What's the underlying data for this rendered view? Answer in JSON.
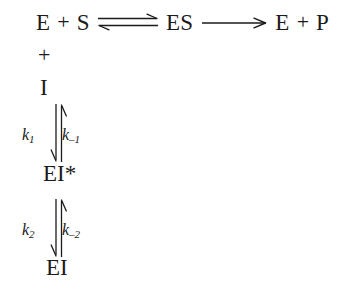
{
  "diagram": {
    "type": "reaction-scheme",
    "background_color": "#ffffff",
    "text_color": "#1b1b1b",
    "top_reaction": {
      "reactant_enzyme": "E",
      "plus_1": "+",
      "reactant_substrate": "S",
      "equilibrium_arrow": "equilibrium-arrow-icon",
      "complex": "ES",
      "forward_arrow": "right-arrow-icon",
      "product_enzyme": "E",
      "plus_2": "+",
      "product": "P"
    },
    "inhibitor_branch": {
      "plus": "+",
      "inhibitor": "I"
    },
    "step_1": {
      "arrow": "vertical-double-arrow-icon",
      "forward_rate_symbol": "k",
      "forward_rate_subscript": "1",
      "reverse_rate_symbol": "k",
      "reverse_rate_subscript": "–1",
      "product": "EI*"
    },
    "step_2": {
      "arrow": "vertical-double-arrow-icon",
      "forward_rate_symbol": "k",
      "forward_rate_subscript": "2",
      "reverse_rate_symbol": "k",
      "reverse_rate_subscript": "–2",
      "product": "EI"
    }
  }
}
